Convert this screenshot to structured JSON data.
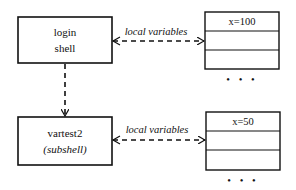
{
  "diagram": {
    "nodes": [
      {
        "id": "login",
        "lines": [
          "login",
          "shell"
        ],
        "italic": [
          false,
          false
        ]
      },
      {
        "id": "vartest2",
        "lines": [
          "vartest2",
          "(subshell)"
        ],
        "italic": [
          false,
          true
        ]
      }
    ],
    "tables": [
      {
        "id": "login-vars",
        "rows": [
          "x=100",
          "",
          ""
        ],
        "continuation": "• • •"
      },
      {
        "id": "vartest2-vars",
        "rows": [
          "x=50",
          "",
          ""
        ],
        "continuation": "• • •"
      }
    ],
    "edges": [
      {
        "from": "login",
        "to": "vartest2",
        "style": "dashed",
        "direction": "forward",
        "label": ""
      },
      {
        "from": "login",
        "to": "login-vars",
        "style": "dashed",
        "direction": "both",
        "label": "local variables"
      },
      {
        "from": "vartest2",
        "to": "vartest2-vars",
        "style": "dashed",
        "direction": "forward",
        "label": "local variables"
      }
    ]
  }
}
